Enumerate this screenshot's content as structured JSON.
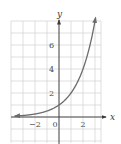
{
  "chart_data": {
    "type": "line",
    "title": "",
    "xlabel": "x",
    "ylabel": "y",
    "xlim": [
      -4,
      3.5
    ],
    "ylim": [
      -2,
      8
    ],
    "grid": true,
    "grid_step": 1,
    "x_ticks": [
      {
        "value": -2,
        "label": "−2"
      },
      {
        "value": 0,
        "label": "0"
      },
      {
        "value": 2,
        "label": "2"
      }
    ],
    "y_ticks": [
      {
        "value": 2,
        "label": "2"
      },
      {
        "value": 4,
        "label": "4"
      },
      {
        "value": 6,
        "label": "6"
      }
    ],
    "series": [
      {
        "name": "y = 2^x",
        "function": "2^x",
        "x": [
          -4,
          -3,
          -2,
          -1,
          0,
          1,
          2,
          3
        ],
        "values": [
          0.0625,
          0.125,
          0.25,
          0.5,
          1,
          2,
          4,
          8
        ],
        "left_arrow": true,
        "right_arrow": true
      }
    ],
    "colors": {
      "grid": "#c9c9c9",
      "axis": "#3a3a3a",
      "curve": "#6b6b6b"
    }
  }
}
